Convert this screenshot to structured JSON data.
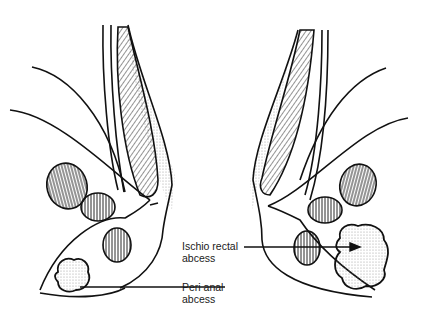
{
  "diagram": {
    "labels": [
      {
        "id": "ischio_rectal",
        "line1": "Ischio rectal",
        "line2": "abcess"
      },
      {
        "id": "peri_anal",
        "line1": "Peri anal",
        "line2": "abcess"
      }
    ],
    "colors": {
      "line": "#111111",
      "background": "#ffffff",
      "stipple": "#9a9a9a"
    }
  }
}
